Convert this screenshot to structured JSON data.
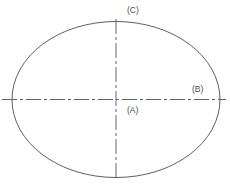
{
  "diagram": {
    "type": "engineering-drawing",
    "background_color": "#ffffff",
    "shape": {
      "name": "ellipse",
      "outline_color": "#4d4d4d",
      "outline_width": 0.9,
      "fill": "none",
      "center_x": 116,
      "center_y": 99.5,
      "semi_axis_x": 104,
      "semi_axis_y": 78,
      "left_edge_x": 12,
      "right_edge_x": 220,
      "top_edge_y": 22,
      "bottom_edge_y": 178
    },
    "center_lines": [
      {
        "name": "horizontal-centerline",
        "orientation": "horizontal",
        "color": "#555555",
        "width": 0.9,
        "style": "dash-dot",
        "dash_pattern": "15 3 3 3",
        "y": 99.5,
        "x_start": 2,
        "x_end": 226
      },
      {
        "name": "vertical-centerline",
        "orientation": "vertical",
        "color": "#555555",
        "width": 0.9,
        "style": "dash-dot",
        "dash_pattern": "15 3 3 3",
        "x": 116,
        "y_start": 19,
        "y_end": 181
      }
    ],
    "labels": [
      {
        "id": "C",
        "text": "(C)",
        "color": "#4d4d4d",
        "font_size": 8.5,
        "x": 127,
        "y": 5,
        "anchor": "top-of-vertical-centerline",
        "meaning": "vertical center line / minor axis direction"
      },
      {
        "id": "B",
        "text": "(B)",
        "color": "#4d4d4d",
        "font_size": 8.5,
        "x": 192,
        "y": 84,
        "anchor": "right-end-of-horizontal-centerline",
        "meaning": "horizontal center line / major axis direction"
      },
      {
        "id": "A",
        "text": "(A)",
        "color": "#4d4d4d",
        "font_size": 8.5,
        "x": 127,
        "y": 105,
        "anchor": "below-center-intersection",
        "meaning": "center point of the ellipse"
      }
    ]
  },
  "canvas": {
    "width": 230,
    "height": 188
  }
}
